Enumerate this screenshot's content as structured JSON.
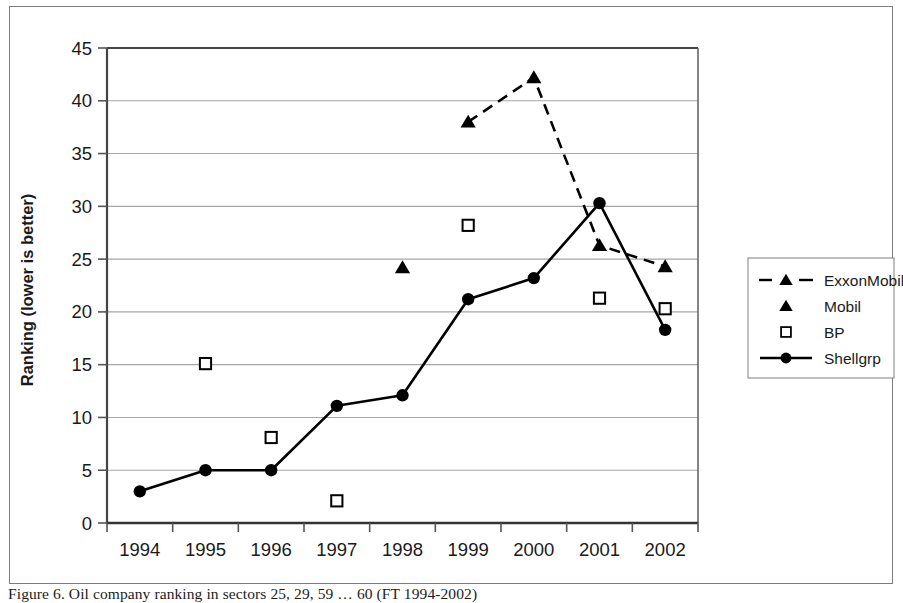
{
  "figure": {
    "caption": "Figure 6. Oil company ranking in sectors 25, 29, 59 … 60 (FT 1994-2002)",
    "frame_color": "#7d7d7d",
    "background": "#ffffff",
    "ink_color": "#000000",
    "gridline_color": "#a6a6a6"
  },
  "chart_data": {
    "type": "line",
    "title": "",
    "subtitle": "",
    "xlabel": "",
    "ylabel": "Ranking (lower is better)",
    "categories": [
      "1994",
      "1995",
      "1996",
      "1997",
      "1998",
      "1999",
      "2000",
      "2001",
      "2002"
    ],
    "xtick_labels": [
      "1994",
      "1995",
      "1996",
      "1997",
      "1998",
      "1999",
      "2000",
      "2001",
      "2002"
    ],
    "ytick_labels": [
      "0",
      "5",
      "10",
      "15",
      "20",
      "25",
      "30",
      "35",
      "40",
      "45"
    ],
    "ylim": [
      0,
      45
    ],
    "ytick_step": 5,
    "grid": "horizontal",
    "legend_position": "right",
    "series": [
      {
        "name": "ExxonMobil",
        "marker": "triangle-filled",
        "line": "dashed",
        "values": [
          null,
          null,
          null,
          null,
          null,
          38.0,
          42.2,
          26.3,
          24.3
        ]
      },
      {
        "name": "Mobil",
        "marker": "triangle-filled",
        "line": "none",
        "values": [
          null,
          null,
          null,
          null,
          24.2,
          null,
          null,
          null,
          null
        ]
      },
      {
        "name": "BP",
        "marker": "square-open",
        "line": "none",
        "values": [
          null,
          15.1,
          8.1,
          2.1,
          null,
          28.2,
          null,
          21.3,
          20.3
        ]
      },
      {
        "name": "Shellgrp",
        "marker": "circle-filled",
        "line": "solid",
        "values": [
          3.0,
          5.0,
          5.0,
          11.1,
          12.1,
          21.2,
          23.2,
          30.3,
          18.3
        ]
      }
    ]
  },
  "legend": {
    "entries": [
      {
        "label": "ExxonMobil",
        "marker": "triangle-filled",
        "line": "dashed"
      },
      {
        "label": "Mobil",
        "marker": "triangle-filled",
        "line": "none"
      },
      {
        "label": "BP",
        "marker": "square-open",
        "line": "none"
      },
      {
        "label": "Shellgrp",
        "marker": "circle-filled",
        "line": "solid"
      }
    ]
  }
}
